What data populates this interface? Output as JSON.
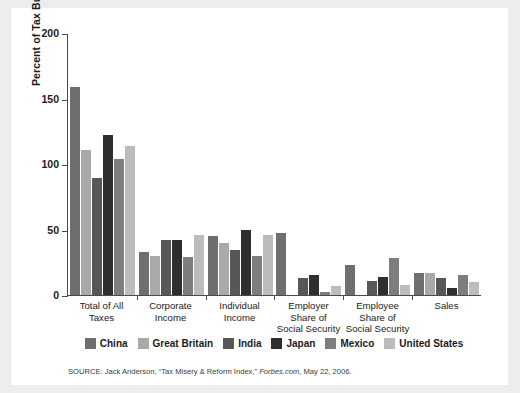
{
  "figure": {
    "background": "#ffffff",
    "page_background": "#eceded",
    "axis_color": "#4a4a4a"
  },
  "source_note": {
    "prefix": "SOURCE: Jack Anderson, “Tax Misery & Reform Index,” ",
    "italic": "Forbes.com",
    "suffix": ", May 22, 2006."
  },
  "chart_data": {
    "type": "bar",
    "title": "",
    "xlabel": "",
    "ylabel": "Percent of Tax Burden",
    "ylim": [
      0,
      200
    ],
    "yticks": [
      0,
      50,
      100,
      150,
      200
    ],
    "ytick_labels": [
      "0",
      "50",
      "100",
      "150",
      "200"
    ],
    "grid": false,
    "legend_position": "bottom",
    "categories": [
      "Total of All\nTaxes",
      "Corporate\nIncome",
      "Individual\nIncome",
      "Employer\nShare of\nSocial Security",
      "Employee\nShare of\nSocial Security",
      "Sales"
    ],
    "series": [
      {
        "name": "China",
        "color": "#6f6f6f",
        "values": [
          159,
          33,
          45,
          47,
          23,
          17
        ]
      },
      {
        "name": "Great Britain",
        "color": "#a9a9a9",
        "values": [
          111,
          30,
          40,
          0,
          0,
          17
        ]
      },
      {
        "name": "India",
        "color": "#575757",
        "values": [
          89,
          42,
          34,
          13,
          11,
          13
        ]
      },
      {
        "name": "Japan",
        "color": "#2e2e2e",
        "values": [
          122,
          42,
          50,
          15,
          14,
          5
        ]
      },
      {
        "name": "Mexico",
        "color": "#7d7d7d",
        "values": [
          104,
          29,
          30,
          2,
          28,
          15
        ]
      },
      {
        "name": "United States",
        "color": "#bcbcbc",
        "values": [
          114,
          46,
          46,
          7,
          8,
          10
        ]
      }
    ]
  }
}
